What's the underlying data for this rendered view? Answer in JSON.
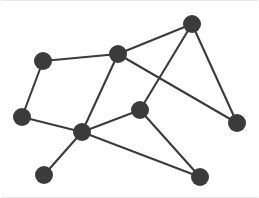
{
  "figure": {
    "width": 259,
    "height": 198,
    "background_color": "#ffffff",
    "node_color": "#3b3b3b",
    "edge_color": "#3b3b3b",
    "frame_color": "#e8e8e8",
    "node_radius": 9,
    "edge_width": 2.1
  },
  "chart_data": {
    "type": "scatter",
    "title": "",
    "xlabel": "",
    "ylabel": "",
    "grid": false,
    "legend": "none",
    "xlim": [
      0,
      259
    ],
    "ylim": [
      198,
      0
    ],
    "graph": {
      "directed": false,
      "node_count": 10,
      "edge_count": 13,
      "nodes": [
        {
          "id": "n1",
          "label": "",
          "x": 43,
          "y": 61,
          "degree": 2
        },
        {
          "id": "n2",
          "label": "",
          "x": 118,
          "y": 54,
          "degree": 4
        },
        {
          "id": "n3",
          "label": "",
          "x": 192,
          "y": 24,
          "degree": 3
        },
        {
          "id": "n4",
          "label": "",
          "x": 22,
          "y": 117,
          "degree": 2
        },
        {
          "id": "n5",
          "label": "",
          "x": 140,
          "y": 110,
          "degree": 3
        },
        {
          "id": "n6",
          "label": "",
          "x": 237,
          "y": 123,
          "degree": 2
        },
        {
          "id": "n7",
          "label": "",
          "x": 82,
          "y": 132,
          "degree": 5
        },
        {
          "id": "n8",
          "label": "",
          "x": 44,
          "y": 175,
          "degree": 1
        },
        {
          "id": "n9",
          "label": "",
          "x": 200,
          "y": 177,
          "degree": 2
        }
      ],
      "edges": [
        {
          "source": "n1",
          "target": "n2"
        },
        {
          "source": "n1",
          "target": "n4"
        },
        {
          "source": "n2",
          "target": "n3"
        },
        {
          "source": "n2",
          "target": "n7"
        },
        {
          "source": "n2",
          "target": "n6"
        },
        {
          "source": "n3",
          "target": "n5"
        },
        {
          "source": "n3",
          "target": "n6"
        },
        {
          "source": "n4",
          "target": "n7"
        },
        {
          "source": "n5",
          "target": "n7"
        },
        {
          "source": "n5",
          "target": "n9"
        },
        {
          "source": "n7",
          "target": "n8"
        },
        {
          "source": "n7",
          "target": "n9"
        }
      ]
    }
  }
}
